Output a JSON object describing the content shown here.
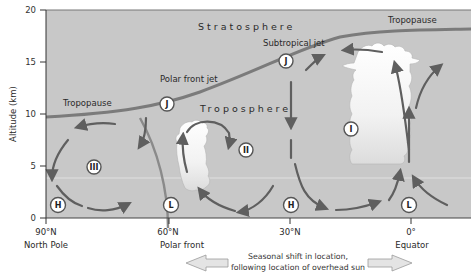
{
  "figure": {
    "y_axis": {
      "label": "Altitude (km)",
      "ticks": [
        "0",
        "5",
        "10",
        "15",
        "20"
      ],
      "range": [
        0,
        20
      ]
    },
    "x_axis": {
      "ticks": [
        {
          "value": "90°N",
          "sub": "North Pole"
        },
        {
          "value": "60°N",
          "sub": ""
        },
        {
          "value": "30°N",
          "sub": ""
        },
        {
          "value": "0°",
          "sub": "Equator"
        }
      ],
      "polar_front_label": "Polar front"
    },
    "layers": {
      "stratosphere": "Stratosphere",
      "troposphere": "Troposphere",
      "tropopause_left": "Tropopause",
      "tropopause_right": "Tropopause"
    },
    "jets": {
      "polar_front": "Polar front jet",
      "subtropical": "Subtropical jet",
      "marker": "J"
    },
    "cells": [
      "I",
      "II",
      "III"
    ],
    "pressure": {
      "high": "H",
      "low": "L"
    },
    "footer": {
      "line1": "Seasonal shift in location,",
      "line2": "following location of overhead sun"
    },
    "colors": {
      "stratosphere": "#c9c9c9",
      "troposphere": "#c2c2c2",
      "tropopause_line": "#7a7a7a",
      "arrow": "#5f5f5f",
      "cloud": "#f4f4f4"
    }
  }
}
